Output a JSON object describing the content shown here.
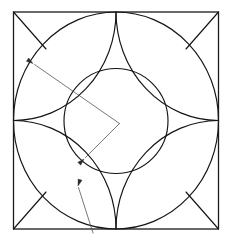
{
  "figure": {
    "canvas": {
      "width": 232,
      "height": 241,
      "background": "#ffffff"
    },
    "colors": {
      "outline": "#141414",
      "square": "#1a1a1a",
      "leader": "#4a4a4a",
      "arrowhead": "#2a2a2a",
      "background": "#ffffff"
    },
    "square": {
      "name": "bounding-square",
      "left": 13.5,
      "top": 12.0,
      "right": 218.5,
      "bottom": 229.0,
      "width": 205.0,
      "height": 217.0,
      "stroke_width": 1.3
    },
    "inscribed_circle": {
      "name": "inscribed-circle",
      "cx": 116.0,
      "cy": 120.5,
      "rx": 102.5,
      "ry": 108.5,
      "stroke_width": 1.15
    },
    "central_circle": {
      "name": "central-circle",
      "cx": 116.0,
      "cy": 121.0,
      "rx": 52.0,
      "ry": 52.5,
      "stroke_width": 1.15
    },
    "corner_arcs": [
      {
        "name": "corner-arc-top-left",
        "center_x": 13.5,
        "center_y": 12.0,
        "rx": 102.5,
        "ry": 108.5,
        "start_x": 116.0,
        "start_y": 12.0,
        "end_x": 13.5,
        "end_y": 120.5,
        "sweep": 1
      },
      {
        "name": "corner-arc-top-right",
        "center_x": 218.5,
        "center_y": 12.0,
        "rx": 102.5,
        "ry": 108.5,
        "start_x": 218.5,
        "start_y": 120.5,
        "end_x": 116.0,
        "end_y": 12.0,
        "sweep": 1
      },
      {
        "name": "corner-arc-bottom-right",
        "center_x": 218.5,
        "center_y": 229.0,
        "rx": 102.5,
        "ry": 108.5,
        "start_x": 116.0,
        "start_y": 229.0,
        "end_x": 218.5,
        "end_y": 120.5,
        "sweep": 1
      },
      {
        "name": "corner-arc-bottom-left",
        "center_x": 13.5,
        "center_y": 229.0,
        "rx": 102.5,
        "ry": 108.5,
        "start_x": 13.5,
        "start_y": 120.5,
        "end_x": 116.0,
        "end_y": 229.0,
        "sweep": 1
      }
    ],
    "corner_diagonals": [
      {
        "name": "corner-chord-top-left",
        "x1": 13.5,
        "y1": 12.0,
        "x2": 46.0,
        "y2": 49.0
      },
      {
        "name": "corner-chord-top-right",
        "x1": 218.5,
        "y1": 12.0,
        "x2": 186.0,
        "y2": 49.0
      },
      {
        "name": "corner-chord-bottom-right",
        "x1": 218.5,
        "y1": 229.0,
        "x2": 186.0,
        "y2": 192.0
      },
      {
        "name": "corner-chord-bottom-left",
        "x1": 13.5,
        "y1": 229.0,
        "x2": 46.0,
        "y2": 192.0
      }
    ],
    "leaders": [
      {
        "name": "leader-inscribed-circle",
        "points": "34.5,64.5 119.5,123.5",
        "arrow_tip_x": 33.0,
        "arrow_tip_y": 63.5,
        "arrow_angle_deg": 215,
        "target": "inscribed-circle"
      },
      {
        "name": "leader-central-circle",
        "points": "119.5,123.5 85.5,157.5",
        "arrow_tip_x": 84.0,
        "arrow_tip_y": 159.0,
        "arrow_angle_deg": 135,
        "target": "central-circle"
      },
      {
        "name": "leader-corner-arc",
        "points": "93.0,233.0 78.5,187.5",
        "arrow_tip_x": 78.0,
        "arrow_tip_y": 186.0,
        "arrow_angle_deg": 288,
        "target": "corner-arc-bottom-left"
      }
    ],
    "arrow_size": 7.0
  }
}
